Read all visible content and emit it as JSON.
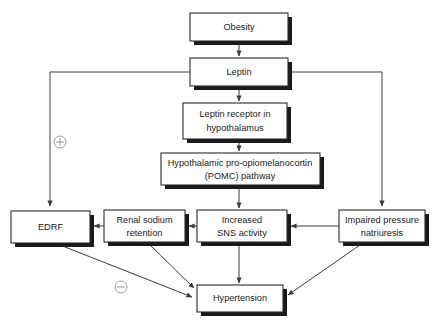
{
  "diagram": {
    "colors": {
      "box_fill": "#ffffff",
      "box_stroke": "#2b2b2b",
      "shadow": "#1a1a1a",
      "connector": "#3a3a3a",
      "sign": "#8c8c8c"
    },
    "nodes": [
      {
        "id": "obesity",
        "label": "Obesity",
        "line1": "Obesity",
        "line2": ""
      },
      {
        "id": "leptin",
        "label": "Leptin",
        "line1": "Leptin",
        "line2": ""
      },
      {
        "id": "receptor",
        "label": "Leptin receptor in hypothalamus",
        "line1": "Leptin receptor in",
        "line2": "hypothalamus"
      },
      {
        "id": "pomc",
        "label": "Hypothalamic pro-opiomelanocortin (POMC) pathway",
        "line1": "Hypothalamic pro-opiomelanocortin",
        "line2": "(POMC) pathway"
      },
      {
        "id": "edrf",
        "label": "EDRF",
        "line1": "EDRF",
        "line2": ""
      },
      {
        "id": "renal",
        "label": "Renal sodium retention",
        "line1": "Renal sodium",
        "line2": "retention"
      },
      {
        "id": "sns",
        "label": "Increased SNS activity",
        "line1": "Increased",
        "line2": "SNS activity"
      },
      {
        "id": "natriuresis",
        "label": "Impaired pressure natriuresis",
        "line1": "Impaired pressure",
        "line2": "natriuresis"
      },
      {
        "id": "hypertension",
        "label": "Hypertension",
        "line1": "Hypertension",
        "line2": ""
      }
    ],
    "signs": [
      {
        "id": "plus",
        "symbol": "+",
        "meaning": "positive effect"
      },
      {
        "id": "minus",
        "symbol": "−",
        "meaning": "negative effect"
      }
    ],
    "edges": [
      {
        "from": "obesity",
        "to": "leptin"
      },
      {
        "from": "leptin",
        "to": "receptor"
      },
      {
        "from": "receptor",
        "to": "pomc"
      },
      {
        "from": "pomc",
        "to": "sns"
      },
      {
        "from": "leptin",
        "to": "edrf",
        "sign": "+"
      },
      {
        "from": "leptin",
        "to": "natriuresis"
      },
      {
        "from": "natriuresis",
        "to": "sns"
      },
      {
        "from": "sns",
        "to": "renal"
      },
      {
        "from": "renal",
        "to": "edrf"
      },
      {
        "from": "sns",
        "to": "hypertension"
      },
      {
        "from": "renal",
        "to": "hypertension"
      },
      {
        "from": "edrf",
        "to": "hypertension",
        "sign": "−"
      },
      {
        "from": "natriuresis",
        "to": "hypertension"
      }
    ]
  }
}
